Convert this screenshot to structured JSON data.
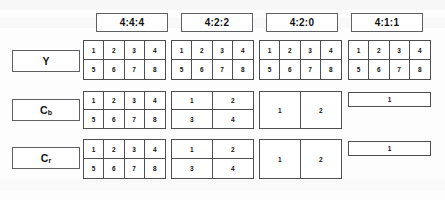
{
  "headers": [
    {
      "id": "h444",
      "label": "4:4:4"
    },
    {
      "id": "h422",
      "label": "4:2:2"
    },
    {
      "id": "h420",
      "label": "4:2:0"
    },
    {
      "id": "h411",
      "label": "4:1:1"
    }
  ],
  "row_labels": [
    {
      "id": "y",
      "text": "Y",
      "base": "Y",
      "sub": ""
    },
    {
      "id": "cb",
      "text": "Cb",
      "base": "C",
      "sub": "b"
    },
    {
      "id": "cr",
      "text": "Cr",
      "base": "C",
      "sub": "r"
    }
  ],
  "chart_data": {
    "type": "table",
    "columns": [
      "4:4:4",
      "4:2:2",
      "4:2:0",
      "4:1:1"
    ],
    "rows": [
      "Y",
      "Cb",
      "Cr"
    ],
    "cells": [
      {
        "row": "Y",
        "column": "4:4:4",
        "cols": 4,
        "rows": 2,
        "values": [
          1,
          2,
          3,
          4,
          5,
          6,
          7,
          8
        ]
      },
      {
        "row": "Y",
        "column": "4:2:2",
        "cols": 4,
        "rows": 2,
        "values": [
          1,
          2,
          3,
          4,
          5,
          6,
          7,
          8
        ]
      },
      {
        "row": "Y",
        "column": "4:2:0",
        "cols": 4,
        "rows": 2,
        "values": [
          1,
          2,
          3,
          4,
          5,
          6,
          7,
          8
        ]
      },
      {
        "row": "Y",
        "column": "4:1:1",
        "cols": 4,
        "rows": 2,
        "values": [
          1,
          2,
          3,
          4,
          5,
          6,
          7,
          8
        ]
      },
      {
        "row": "Cb",
        "column": "4:4:4",
        "cols": 4,
        "rows": 2,
        "values": [
          1,
          2,
          3,
          4,
          5,
          6,
          7,
          8
        ]
      },
      {
        "row": "Cb",
        "column": "4:2:2",
        "cols": 2,
        "rows": 2,
        "values": [
          1,
          2,
          3,
          4
        ]
      },
      {
        "row": "Cb",
        "column": "4:2:0",
        "cols": 2,
        "rows": 1,
        "values": [
          1,
          2
        ]
      },
      {
        "row": "Cb",
        "column": "4:1:1",
        "cols": 1,
        "rows": 1,
        "values": [
          1
        ]
      },
      {
        "row": "Cr",
        "column": "4:4:4",
        "cols": 4,
        "rows": 2,
        "values": [
          1,
          2,
          3,
          4,
          5,
          6,
          7,
          8
        ]
      },
      {
        "row": "Cr",
        "column": "4:2:2",
        "cols": 2,
        "rows": 2,
        "values": [
          1,
          2,
          3,
          4
        ]
      },
      {
        "row": "Cr",
        "column": "4:2:0",
        "cols": 2,
        "rows": 1,
        "values": [
          1,
          2
        ]
      },
      {
        "row": "Cr",
        "column": "4:1:1",
        "cols": 1,
        "rows": 1,
        "values": [
          1
        ]
      }
    ]
  },
  "layout": {
    "header_boxes": [
      {
        "id": "h444",
        "x": 96,
        "y": 13,
        "w": 72,
        "h": 19
      },
      {
        "id": "h422",
        "x": 181,
        "y": 13,
        "w": 72,
        "h": 19
      },
      {
        "id": "h420",
        "x": 266,
        "y": 13,
        "w": 72,
        "h": 19
      },
      {
        "id": "h411",
        "x": 351,
        "y": 13,
        "w": 72,
        "h": 19
      }
    ],
    "label_boxes": [
      {
        "id": "y",
        "x": 12,
        "y": 50,
        "w": 68,
        "h": 22
      },
      {
        "id": "cb",
        "x": 12,
        "y": 99,
        "w": 68,
        "h": 22
      },
      {
        "id": "cr",
        "x": 12,
        "y": 147,
        "w": 68,
        "h": 22
      }
    ],
    "grids": [
      {
        "row": "Y",
        "column": "4:4:4",
        "x": 83,
        "y": 40,
        "w": 83,
        "h": 40
      },
      {
        "row": "Y",
        "column": "4:2:2",
        "x": 171,
        "y": 40,
        "w": 83,
        "h": 40
      },
      {
        "row": "Y",
        "column": "4:2:0",
        "x": 259,
        "y": 40,
        "w": 83,
        "h": 40
      },
      {
        "row": "Y",
        "column": "4:1:1",
        "x": 348,
        "y": 40,
        "w": 83,
        "h": 40
      },
      {
        "row": "Cb",
        "column": "4:4:4",
        "x": 83,
        "y": 91,
        "w": 83,
        "h": 38
      },
      {
        "row": "Cb",
        "column": "4:2:2",
        "x": 171,
        "y": 91,
        "w": 83,
        "h": 38
      },
      {
        "row": "Cb",
        "column": "4:2:0",
        "x": 259,
        "y": 91,
        "w": 83,
        "h": 38
      },
      {
        "row": "Cb",
        "column": "4:1:1",
        "x": 348,
        "y": 92,
        "w": 83,
        "h": 15
      },
      {
        "row": "Cr",
        "column": "4:4:4",
        "x": 83,
        "y": 139,
        "w": 83,
        "h": 40
      },
      {
        "row": "Cr",
        "column": "4:2:2",
        "x": 171,
        "y": 139,
        "w": 83,
        "h": 40
      },
      {
        "row": "Cr",
        "column": "4:2:0",
        "x": 259,
        "y": 139,
        "w": 83,
        "h": 40
      },
      {
        "row": "Cr",
        "column": "4:1:1",
        "x": 348,
        "y": 141,
        "w": 83,
        "h": 15
      }
    ]
  },
  "colors": {
    "background": "#fdfdfd",
    "box_border": "#5f6063",
    "grid_border": "#4d4e50",
    "text": "#111111"
  }
}
